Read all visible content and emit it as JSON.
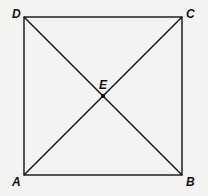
{
  "figure": {
    "type": "geometry",
    "shape": "square",
    "points": {
      "A": {
        "label": "A",
        "x": 24,
        "y": 175
      },
      "B": {
        "label": "B",
        "x": 182,
        "y": 175
      },
      "C": {
        "label": "C",
        "x": 182,
        "y": 17
      },
      "D": {
        "label": "D",
        "x": 24,
        "y": 17
      },
      "E": {
        "label": "E",
        "x": 103,
        "y": 96
      }
    },
    "segments": [
      "AB",
      "BC",
      "CD",
      "DA",
      "AC",
      "BD"
    ],
    "colors": {
      "line": "#111111",
      "background": "#f3f3f1"
    }
  }
}
